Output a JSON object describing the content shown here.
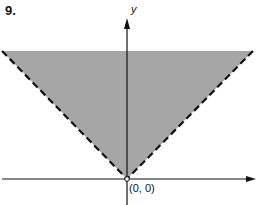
{
  "problem_number": "9.",
  "axes": {
    "y_label": "y",
    "x_label": ""
  },
  "origin_label": "(0, 0)",
  "region": {
    "description": "Shaded region above |y| = |x| style V with dashed boundaries (strict inequality), bounded above by top of figure",
    "fill_color": "#a6a6a6",
    "boundary_style": "dashed",
    "vertex": "(0, 0)"
  }
}
